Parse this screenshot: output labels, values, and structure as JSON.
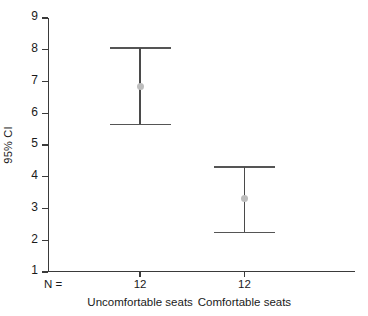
{
  "chart_data": {
    "type": "scatter",
    "title": "",
    "subtitle": "",
    "xlabel": "",
    "ylabel": "95% CI",
    "ylim": [
      1,
      9
    ],
    "ytick_labels": [
      "9",
      "8",
      "7",
      "6",
      "5",
      "4",
      "3",
      "2",
      "1"
    ],
    "ytick_values": [
      9,
      8,
      7,
      6,
      5,
      4,
      3,
      2,
      1
    ],
    "grid": false,
    "legend": null,
    "categories": [
      "Uncomfortable seats",
      "Comfortable seats"
    ],
    "n_label": "N =",
    "n_values": [
      "12",
      "12"
    ],
    "series": [
      {
        "name": "95% CI",
        "points": [
          {
            "category": "Uncomfortable seats",
            "mean": 6.85,
            "ci_lower": 5.65,
            "ci_upper": 8.05,
            "n": 12
          },
          {
            "category": "Comfortable seats",
            "mean": 3.3,
            "ci_lower": 2.25,
            "ci_upper": 4.3,
            "n": 12
          }
        ]
      }
    ],
    "colors": {
      "axis": "#3a3a3a",
      "whisker": "#4a4a4a",
      "cap": "#555555",
      "mean_marker": "#bdbdbd",
      "background": "#ffffff",
      "text": "#1a1a1a"
    }
  },
  "axis": {
    "y_title": "95% CI"
  },
  "bottom": {
    "n_label": "N =",
    "n_1": "12",
    "n_2": "12",
    "cat_1": "Uncomfortable seats",
    "cat_2": "Comfortable seats"
  },
  "yticks": {
    "t9": "9",
    "t8": "8",
    "t7": "7",
    "t6": "6",
    "t5": "5",
    "t4": "4",
    "t3": "3",
    "t2": "2",
    "t1": "1"
  }
}
